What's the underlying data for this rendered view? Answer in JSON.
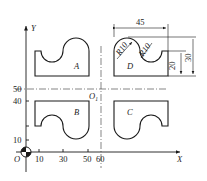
{
  "diagram": {
    "type": "mirrored-part-layout",
    "axes": {
      "x_label": "X",
      "y_label": "Y",
      "origin_label": "O",
      "x_ticks": [
        "10",
        "30",
        "50",
        "60"
      ],
      "y_ticks": [
        "10",
        "40",
        "50"
      ]
    },
    "center_point_label": "O",
    "center_point_subscript": "1",
    "parts": [
      {
        "id": "A",
        "label": "A",
        "quadrant": "top-left"
      },
      {
        "id": "B",
        "label": "B",
        "quadrant": "bottom-left"
      },
      {
        "id": "C",
        "label": "C",
        "quadrant": "bottom-right"
      },
      {
        "id": "D",
        "label": "D",
        "quadrant": "top-right"
      }
    ],
    "dimensions": {
      "width": "45",
      "height_total": "30",
      "height_step": "20",
      "radius_1": "R10",
      "radius_2": "R10"
    }
  }
}
